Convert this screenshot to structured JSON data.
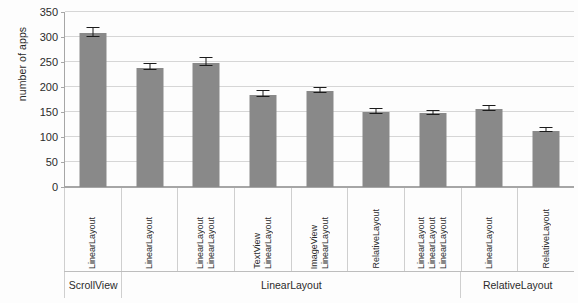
{
  "chart_data": {
    "type": "bar",
    "title": "",
    "xlabel": "",
    "ylabel": "number of apps",
    "ylim": [
      0,
      350
    ],
    "yticks": [
      0,
      50,
      100,
      150,
      200,
      250,
      300,
      350
    ],
    "grid": true,
    "legend": "none",
    "bar_color": "#898989",
    "error_bar_color": "#1c1c1c",
    "categories": [
      "LinearLayout",
      "LinearLayout",
      "LinearLayout\nLinearLayout",
      "TextView\nLinearLayout",
      "ImageView\nLinearLayout",
      "RelativeLayout",
      "LinearLayout\nLinearLayout\nLinearLayout",
      "LinearLayout",
      "RelativeLayout"
    ],
    "category_lines": [
      [
        "LinearLayout"
      ],
      [
        "LinearLayout"
      ],
      [
        "LinearLayout",
        "LinearLayout"
      ],
      [
        "TextView",
        "LinearLayout"
      ],
      [
        "ImageView",
        "LinearLayout"
      ],
      [
        "RelativeLayout"
      ],
      [
        "LinearLayout",
        "LinearLayout",
        "LinearLayout"
      ],
      [
        "LinearLayout"
      ],
      [
        "RelativeLayout"
      ]
    ],
    "values": [
      308,
      238,
      249,
      185,
      192,
      150,
      148,
      157,
      113
    ],
    "errors": [
      9,
      6,
      8,
      5,
      5,
      5,
      4,
      5,
      4
    ],
    "groups": [
      {
        "label": "ScrollView",
        "span": 1
      },
      {
        "label": "LinearLayout",
        "span": 6
      },
      {
        "label": "RelativeLayout",
        "span": 2
      }
    ]
  }
}
